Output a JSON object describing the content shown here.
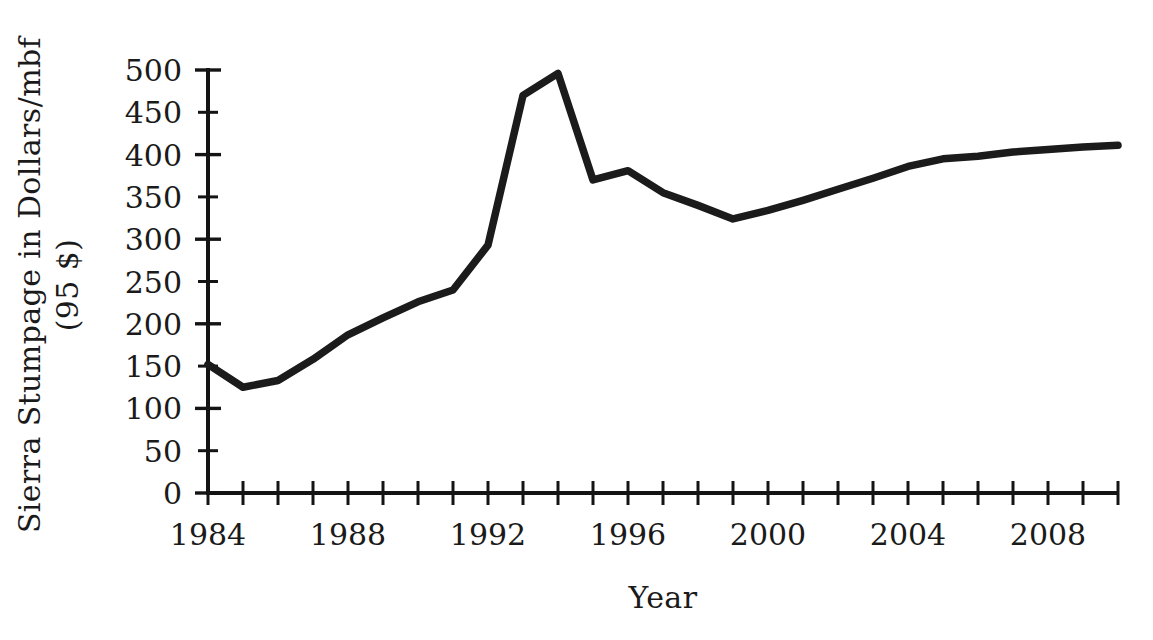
{
  "chart_data": {
    "type": "line",
    "title": "",
    "xlabel": "Year",
    "ylabel_line1": "Sierra Stumpage in Dollars/mbf",
    "ylabel_line2": "(95 $)",
    "xlim": [
      1984,
      2010
    ],
    "ylim": [
      0,
      500
    ],
    "grid": false,
    "legend": null,
    "y_ticks": [
      0,
      50,
      100,
      150,
      200,
      250,
      300,
      350,
      400,
      450,
      500
    ],
    "y_tick_labels": [
      "0",
      "50",
      "100",
      "150",
      "200",
      "250",
      "300",
      "350",
      "400",
      "450",
      "500"
    ],
    "x_ticks": [
      1984,
      1985,
      1986,
      1987,
      1988,
      1989,
      1990,
      1991,
      1992,
      1993,
      1994,
      1995,
      1996,
      1997,
      1998,
      1999,
      2000,
      2001,
      2002,
      2003,
      2004,
      2005,
      2006,
      2007,
      2008,
      2009,
      2010
    ],
    "x_tick_labels_shown": [
      "1984",
      "1988",
      "1992",
      "1996",
      "2000",
      "2004",
      "2008"
    ],
    "x_tick_labels_values": [
      1984,
      1988,
      1992,
      1996,
      2000,
      2004,
      2008
    ],
    "series": [
      {
        "name": "Sierra Stumpage",
        "color": "#1b1b1b",
        "x": [
          1984,
          1985,
          1986,
          1987,
          1988,
          1989,
          1990,
          1991,
          1992,
          1993,
          1994,
          1995,
          1996,
          1997,
          1998,
          1999,
          2000,
          2001,
          2002,
          2003,
          2004,
          2005,
          2006,
          2007,
          2008,
          2009,
          2010
        ],
        "values": [
          152,
          125,
          133,
          158,
          187,
          207,
          226,
          240,
          293,
          470,
          496,
          370,
          381,
          355,
          340,
          324,
          334,
          346,
          359,
          372,
          386,
          395,
          398,
          403,
          406,
          409,
          411
        ]
      }
    ]
  },
  "figure": {
    "axis_color": "#141414",
    "background": "#ffffff"
  }
}
